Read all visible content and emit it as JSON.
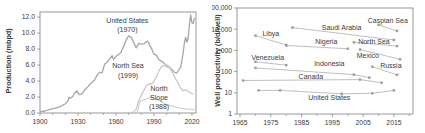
{
  "colors": {
    "frame": "#8c8c8c",
    "tick": "#8c8c8c",
    "text": "#3a3a3a",
    "series_dark": "#a6a6a6",
    "series_light": "#c6c6c6",
    "series_lighter": "#cdcdcd",
    "marker": "#9b9b9b",
    "connector": "#c0c0c0"
  },
  "chart_data": [
    {
      "type": "line",
      "ylabel": "Production (mbpd)",
      "xlabel": "",
      "xlim": [
        1900,
        2023.2
      ],
      "ylim": [
        0,
        12.63
      ],
      "grid": false,
      "xtick_vals": [
        1900,
        1930,
        1960,
        1990,
        2020
      ],
      "xtick_labels": [
        "1900",
        "1930",
        "1960",
        "1990",
        "2020"
      ],
      "xtick_minor": [
        1910,
        1920,
        1940,
        1950,
        1970,
        1980,
        2000,
        2010
      ],
      "ytick_vals": [
        0,
        2,
        4,
        6,
        8,
        10,
        12
      ],
      "ytick_labels": [
        "0.0",
        "2.0",
        "4.0",
        "6.0",
        "8.0",
        "10.0",
        "12.0"
      ],
      "series": [
        {
          "name": "United States",
          "color": "#a6a6a6",
          "width": 1.3,
          "markers": false,
          "points": [
            [
              1900,
              0.18
            ],
            [
              1904,
              0.25
            ],
            [
              1908,
              0.45
            ],
            [
              1912,
              0.6
            ],
            [
              1916,
              0.8
            ],
            [
              1920,
              1.15
            ],
            [
              1922,
              1.5
            ],
            [
              1923,
              1.95
            ],
            [
              1924,
              1.85
            ],
            [
              1926,
              2.1
            ],
            [
              1927,
              2.45
            ],
            [
              1929,
              2.75
            ],
            [
              1931,
              2.3
            ],
            [
              1933,
              2.4
            ],
            [
              1936,
              3.0
            ],
            [
              1938,
              3.3
            ],
            [
              1940,
              3.7
            ],
            [
              1943,
              4.1
            ],
            [
              1945,
              4.7
            ],
            [
              1947,
              5.1
            ],
            [
              1949,
              5.0
            ],
            [
              1951,
              6.1
            ],
            [
              1953,
              6.35
            ],
            [
              1955,
              6.8
            ],
            [
              1957,
              7.15
            ],
            [
              1958,
              6.7
            ],
            [
              1960,
              7.05
            ],
            [
              1962,
              7.3
            ],
            [
              1964,
              7.6
            ],
            [
              1966,
              8.3
            ],
            [
              1968,
              9.1
            ],
            [
              1970,
              9.64
            ],
            [
              1972,
              9.45
            ],
            [
              1974,
              8.8
            ],
            [
              1976,
              8.15
            ],
            [
              1978,
              8.7
            ],
            [
              1980,
              8.6
            ],
            [
              1982,
              8.65
            ],
            [
              1984,
              8.9
            ],
            [
              1985,
              9.0
            ],
            [
              1986,
              8.7
            ],
            [
              1988,
              8.1
            ],
            [
              1990,
              7.35
            ],
            [
              1992,
              7.2
            ],
            [
              1994,
              6.65
            ],
            [
              1996,
              6.45
            ],
            [
              1998,
              6.25
            ],
            [
              2000,
              5.8
            ],
            [
              2002,
              5.75
            ],
            [
              2004,
              5.45
            ],
            [
              2006,
              5.1
            ],
            [
              2008,
              5.0
            ],
            [
              2010,
              5.5
            ],
            [
              2011,
              5.65
            ],
            [
              2012,
              6.5
            ],
            [
              2013,
              7.5
            ],
            [
              2014,
              8.75
            ],
            [
              2015,
              9.45
            ],
            [
              2016,
              8.85
            ],
            [
              2017,
              9.35
            ],
            [
              2018,
              11.0
            ],
            [
              2019,
              12.25
            ],
            [
              2020,
              11.3
            ],
            [
              2021,
              11.2
            ],
            [
              2022,
              11.9
            ]
          ]
        },
        {
          "name": "North Sea",
          "color": "#c6c6c6",
          "width": 1.2,
          "markers": false,
          "points": [
            [
              1971,
              0.05
            ],
            [
              1974,
              0.1
            ],
            [
              1976,
              0.5
            ],
            [
              1978,
              1.5
            ],
            [
              1980,
              2.2
            ],
            [
              1982,
              2.8
            ],
            [
              1984,
              3.4
            ],
            [
              1986,
              3.65
            ],
            [
              1988,
              3.6
            ],
            [
              1990,
              4.0
            ],
            [
              1992,
              4.5
            ],
            [
              1994,
              5.3
            ],
            [
              1996,
              5.8
            ],
            [
              1998,
              5.95
            ],
            [
              1999,
              6.05
            ],
            [
              2001,
              5.95
            ],
            [
              2003,
              5.5
            ],
            [
              2005,
              4.9
            ],
            [
              2007,
              4.3
            ],
            [
              2009,
              3.8
            ],
            [
              2011,
              3.1
            ],
            [
              2013,
              2.75
            ],
            [
              2015,
              2.9
            ],
            [
              2017,
              2.7
            ],
            [
              2019,
              2.5
            ],
            [
              2021,
              2.35
            ]
          ]
        },
        {
          "name": "North Slope",
          "color": "#cdcdcd",
          "width": 1.1,
          "markers": false,
          "points": [
            [
              1977,
              0.08
            ],
            [
              1978,
              1.0
            ],
            [
              1979,
              1.4
            ],
            [
              1981,
              1.6
            ],
            [
              1983,
              1.7
            ],
            [
              1985,
              1.8
            ],
            [
              1987,
              1.95
            ],
            [
              1988,
              2.03
            ],
            [
              1990,
              1.85
            ],
            [
              1992,
              1.7
            ],
            [
              1994,
              1.55
            ],
            [
              1996,
              1.4
            ],
            [
              1998,
              1.2
            ],
            [
              2000,
              1.0
            ],
            [
              2002,
              0.98
            ],
            [
              2004,
              0.9
            ],
            [
              2006,
              0.78
            ],
            [
              2008,
              0.7
            ],
            [
              2010,
              0.62
            ],
            [
              2012,
              0.55
            ],
            [
              2014,
              0.52
            ],
            [
              2016,
              0.49
            ],
            [
              2018,
              0.47
            ],
            [
              2020,
              0.44
            ],
            [
              2022,
              0.42
            ]
          ]
        }
      ],
      "annotations": [
        {
          "name": "united-states-1970",
          "lines": [
            "United States",
            "(1970)"
          ],
          "x": 1969,
          "y": 11.6
        },
        {
          "name": "north-sea-1999",
          "lines": [
            "North Sea",
            "(1999)"
          ],
          "x": 1969.5,
          "y": 5.9
        },
        {
          "name": "north-slope-1988",
          "lines": [
            "North",
            "Slope",
            "(1988)"
          ],
          "x": 1994,
          "y": 3.12
        }
      ]
    },
    {
      "type": "scatter",
      "ylabel": "Well productivity (b/d/well)",
      "xlabel": "",
      "xlim": [
        1964,
        2021.2
      ],
      "ylim": [
        1,
        100000
      ],
      "ylog": true,
      "grid": false,
      "xtick_vals": [
        1965,
        1975,
        1985,
        1995,
        2005,
        2015
      ],
      "xtick_labels": [
        "1965",
        "1975",
        "1985",
        "1995",
        "2005",
        "2015"
      ],
      "xtick_minor": [
        1970,
        1980,
        1990,
        2000,
        2010,
        2020
      ],
      "ytick_vals": [
        1,
        10,
        100,
        1000,
        10000,
        100000
      ],
      "ytick_labels": [
        "1",
        "10",
        "100",
        "1,000",
        "10,000",
        "100,000"
      ],
      "series": [
        {
          "name": "Libya",
          "color": "#c0c0c0",
          "width": 1,
          "markers": true,
          "points": [
            [
              1970,
              5000
            ],
            [
              1980,
              1800
            ]
          ]
        },
        {
          "name": "Venezuela",
          "color": "#c0c0c0",
          "width": 1,
          "markers": true,
          "points": [
            [
              1970,
              290
            ],
            [
              1980,
              200
            ]
          ]
        },
        {
          "name": "Saudi Arabia",
          "color": "#c0c0c0",
          "width": 1,
          "markers": true,
          "points": [
            [
              1982,
              12000
            ],
            [
              2015,
              3100
            ]
          ]
        },
        {
          "name": "Caspian Sea",
          "color": "#c0c0c0",
          "width": 1,
          "markers": true,
          "points": [
            [
              2010,
              16000
            ],
            [
              2016,
              8300
            ]
          ]
        },
        {
          "name": "Nigeria",
          "color": "#c0c0c0",
          "width": 1,
          "markers": true,
          "points": [
            [
              1980,
              1700
            ],
            [
              2000,
              1200
            ]
          ]
        },
        {
          "name": "North Sea",
          "color": "#c0c0c0",
          "width": 1,
          "markers": true,
          "points": [
            [
              2002,
              2400
            ],
            [
              2016,
              1600
            ]
          ]
        },
        {
          "name": "Mexico",
          "color": "#c0c0c0",
          "width": 1,
          "markers": true,
          "points": [
            [
              2004,
              1100
            ],
            [
              2017,
              380
            ]
          ]
        },
        {
          "name": "Indonesia",
          "color": "#c0c0c0",
          "width": 1,
          "markers": true,
          "points": [
            [
              1970,
              150
            ],
            [
              2002,
              72
            ],
            [
              2007,
              52
            ]
          ]
        },
        {
          "name": "Russia",
          "color": "#c0c0c0",
          "width": 1,
          "markers": true,
          "points": [
            [
              2008,
              170
            ],
            [
              2016,
              70
            ]
          ]
        },
        {
          "name": "Canada",
          "color": "#c0c0c0",
          "width": 1,
          "markers": true,
          "points": [
            [
              1966,
              38
            ],
            [
              2004,
              42
            ],
            [
              2011,
              30
            ]
          ]
        },
        {
          "name": "United States",
          "color": "#c0c0c0",
          "width": 1,
          "markers": true,
          "points": [
            [
              1971,
              13
            ],
            [
              1978,
              13
            ],
            [
              1998,
              9
            ],
            [
              2008,
              9.5
            ],
            [
              2015,
              13
            ]
          ]
        }
      ],
      "annotations": [
        {
          "name": "libya-label",
          "lines": [
            "Libya"
          ],
          "x": 1975,
          "y": 6600
        },
        {
          "name": "saudi-arabia-label",
          "lines": [
            "Saudi Arabia"
          ],
          "x": 1998,
          "y": 12500
        },
        {
          "name": "caspian-sea-label",
          "lines": [
            "Caspian Sea"
          ],
          "x": 2013,
          "y": 27000
        },
        {
          "name": "nigeria-label",
          "lines": [
            "Nigeria"
          ],
          "x": 1993,
          "y": 2500
        },
        {
          "name": "north-sea-label",
          "lines": [
            "North Sea"
          ],
          "x": 2008.5,
          "y": 2500
        },
        {
          "name": "venezuela-label",
          "lines": [
            "Venezuela"
          ],
          "x": 1974,
          "y": 440
        },
        {
          "name": "mexico-label",
          "lines": [
            "Mexico"
          ],
          "x": 2006.5,
          "y": 560
        },
        {
          "name": "indonesia-label",
          "lines": [
            "Indonesia"
          ],
          "x": 1994,
          "y": 235
        },
        {
          "name": "russia-label",
          "lines": [
            "Russia"
          ],
          "x": 2014,
          "y": 185
        },
        {
          "name": "canada-label",
          "lines": [
            "Canada"
          ],
          "x": 1988,
          "y": 57
        },
        {
          "name": "united-states-label",
          "lines": [
            "United States"
          ],
          "x": 1994,
          "y": 6.3
        }
      ]
    }
  ]
}
